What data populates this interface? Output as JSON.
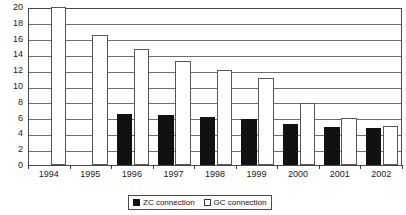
{
  "chart_data": {
    "type": "bar",
    "title": "",
    "xlabel": "",
    "ylabel": "",
    "categories": [
      "1994",
      "1995",
      "1996",
      "1997",
      "1998",
      "1999",
      "2000",
      "2001",
      "2002"
    ],
    "series": [
      {
        "name": "ZC connection",
        "color": "#111111",
        "values": [
          0,
          0,
          6.4,
          6.3,
          6.1,
          5.8,
          5.2,
          4.8,
          4.7
        ]
      },
      {
        "name": "GC connection",
        "color": "#ffffff",
        "values": [
          20,
          16.5,
          14.7,
          13.2,
          12.0,
          11.0,
          7.9,
          6.0,
          5.0
        ]
      }
    ],
    "ylim": [
      0,
      20
    ],
    "ytick_labels": [
      "0",
      "2",
      "4",
      "6",
      "8",
      "10",
      "12",
      "14",
      "16",
      "18",
      "20"
    ],
    "ytick_values": [
      0,
      2,
      4,
      6,
      8,
      10,
      12,
      14,
      16,
      18,
      20
    ],
    "grid": true,
    "grid_axis": "y",
    "legend_position": "bottom-center-right",
    "legend_entries": [
      "ZC connection",
      "GC connection"
    ]
  },
  "legend": {
    "entries": [
      {
        "label": "ZC connection",
        "swatch": "filled-black-square"
      },
      {
        "label": "GC connection",
        "swatch": "outlined-white-square"
      }
    ]
  }
}
